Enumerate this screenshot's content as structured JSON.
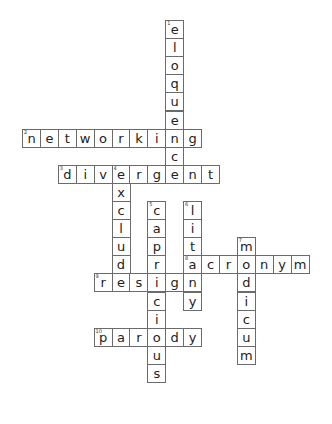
{
  "puzzle": {
    "type": "crossword",
    "words": [
      {
        "number": "1",
        "answer": "eloquence",
        "direction": "down",
        "col": 8,
        "row": 0
      },
      {
        "number": "2",
        "answer": "networking",
        "direction": "across",
        "col": 0,
        "row": 6
      },
      {
        "number": "3",
        "answer": "divergent",
        "direction": "across",
        "col": 2,
        "row": 8
      },
      {
        "number": "4",
        "answer": "exclude",
        "direction": "down",
        "col": 5,
        "row": 8
      },
      {
        "number": "5",
        "answer": "capricious",
        "direction": "down",
        "col": 7,
        "row": 10
      },
      {
        "number": "6",
        "answer": "litany",
        "direction": "down",
        "col": 9,
        "row": 10
      },
      {
        "number": "7",
        "answer": "modicum",
        "direction": "down",
        "col": 12,
        "row": 12
      },
      {
        "number": "8",
        "answer": "acronym",
        "direction": "across",
        "col": 9,
        "row": 13
      },
      {
        "number": "9",
        "answer": "resign",
        "direction": "across",
        "col": 4,
        "row": 14
      },
      {
        "number": "10",
        "answer": "parody",
        "direction": "across",
        "col": 4,
        "row": 17
      }
    ]
  }
}
